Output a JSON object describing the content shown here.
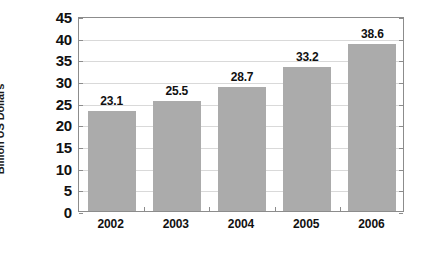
{
  "chart_data": {
    "type": "bar",
    "title": "",
    "subtitle": "",
    "xlabel": "",
    "ylabel": "Billion US Dollars",
    "categories": [
      "2002",
      "2003",
      "2004",
      "2005",
      "2006"
    ],
    "values": [
      23.1,
      25.5,
      28.7,
      33.2,
      38.6
    ],
    "value_labels": [
      "23.1",
      "25.5",
      "28.7",
      "33.2",
      "38.6"
    ],
    "ylim": [
      0,
      45
    ],
    "ytick_step": 5,
    "ytick_labels": [
      "0",
      "5",
      "10",
      "15",
      "20",
      "25",
      "30",
      "35",
      "40",
      "45"
    ],
    "ytick_values": [
      0,
      5,
      10,
      15,
      20,
      25,
      30,
      35,
      40,
      45
    ],
    "grid": true,
    "grid_axis": "y",
    "legend": false,
    "legend_position": "none",
    "series": [
      {
        "name": "Billion US Dollars",
        "values": [
          23.1,
          25.5,
          28.7,
          33.2,
          38.6
        ],
        "color": "#ababab"
      }
    ],
    "colors": {
      "bar_fill": "#ababab",
      "gridline": "#d9d9d9",
      "axis_line": "#8c8c8c",
      "text": "#111111",
      "background": "#ffffff"
    }
  }
}
